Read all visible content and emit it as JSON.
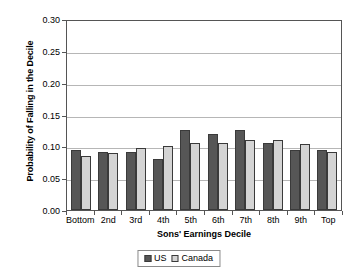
{
  "chart_data": {
    "type": "bar",
    "title": "",
    "xlabel": "Sons' Earnings Decile",
    "ylabel": "Probability of Falling in the Decile",
    "categories": [
      "Bottom",
      "2nd",
      "3rd",
      "4th",
      "5th",
      "6th",
      "7th",
      "8th",
      "9th",
      "Top"
    ],
    "series": [
      {
        "name": "US",
        "color": "#565656",
        "values": [
          0.095,
          0.091,
          0.091,
          0.08,
          0.125,
          0.12,
          0.125,
          0.105,
          0.095,
          0.095
        ]
      },
      {
        "name": "Canada",
        "color": "#d4d4d4",
        "values": [
          0.085,
          0.089,
          0.098,
          0.101,
          0.105,
          0.105,
          0.11,
          0.11,
          0.103,
          0.091
        ]
      }
    ],
    "ylim": [
      0.0,
      0.3
    ],
    "ytick_values": [
      0.0,
      0.05,
      0.1,
      0.15,
      0.2,
      0.25,
      0.3
    ],
    "ytick_labels": [
      "0.00",
      "0.05",
      "0.10",
      "0.15",
      "0.20",
      "0.25",
      "0.30"
    ],
    "grid": "horizontal",
    "legend_position": "bottom-center"
  },
  "legend": {
    "items": [
      {
        "label": "US"
      },
      {
        "label": "Canada"
      }
    ]
  },
  "colors": {
    "us_bar": "#565656",
    "canada_bar": "#d4d4d4",
    "gridline": "#b6b6b6",
    "frame": "#555555",
    "background": "#ffffff"
  }
}
